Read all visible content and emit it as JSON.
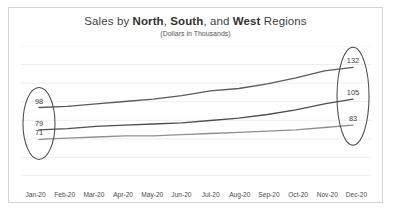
{
  "chart_data": {
    "type": "line",
    "title": "Sales by North, South, and West Regions",
    "title_parts": {
      "lead": "Sales by ",
      "region1": "North",
      "sep1": ", ",
      "region2": "South",
      "sep2": ", and ",
      "region3": "West",
      "tail": " Regions"
    },
    "subtitle": "(Dollars in Thousands)",
    "xlabel": "",
    "ylabel": "",
    "grid": true,
    "legend": "none",
    "ylim": [
      40,
      150
    ],
    "categories": [
      "Jan-20",
      "Feb-20",
      "Mar-20",
      "Apr-20",
      "May-20",
      "Jun-20",
      "Jul-20",
      "Aug-20",
      "Sep-20",
      "Oct-20",
      "Nov-20",
      "Dec-20"
    ],
    "series": [
      {
        "name": "North",
        "color": "#5a5a5a",
        "values": [
          98,
          99,
          101,
          103,
          105,
          108,
          112,
          114,
          118,
          123,
          129,
          132
        ],
        "start_label": "98",
        "end_label": "132"
      },
      {
        "name": "South",
        "color": "#4f4f4f",
        "values": [
          79,
          80,
          82,
          83,
          84,
          85,
          87,
          89,
          92,
          96,
          101,
          105
        ],
        "start_label": "79",
        "end_label": "105"
      },
      {
        "name": "West",
        "color": "#8f8f8f",
        "values": [
          71,
          72,
          73,
          74,
          74,
          75,
          76,
          77,
          78,
          79,
          81,
          83
        ],
        "start_label": "71",
        "end_label": "83"
      }
    ],
    "annotations": {
      "left_callout": {
        "shape": "ellipse",
        "labels": [
          "98",
          "79",
          "71"
        ],
        "at_category": "Jan-20"
      },
      "right_callout": {
        "shape": "ellipse",
        "labels": [
          "132",
          "105",
          "83"
        ],
        "at_category": "Dec-20"
      }
    },
    "colors": {
      "border": "#d4d4d4",
      "gridline": "#e9e9e9",
      "title_text": "#3f3f3f",
      "callout_stroke": "#4a4a4a"
    }
  }
}
